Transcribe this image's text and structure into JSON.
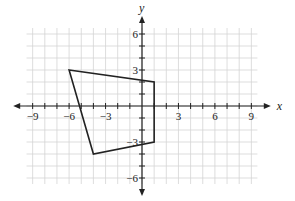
{
  "chart_data": {
    "type": "scatter",
    "title": "",
    "xlabel": "x",
    "ylabel": "y",
    "xlim": [
      -9.5,
      9.5
    ],
    "ylim": [
      -6.5,
      6.5
    ],
    "grid": true,
    "x_ticks": [
      -9,
      -6,
      -3,
      3,
      6,
      9
    ],
    "y_ticks": [
      6,
      3,
      -3,
      -6
    ],
    "x_tick_labels": [
      "−9",
      "−6",
      "−3",
      "3",
      "6",
      "9"
    ],
    "y_tick_labels": [
      "6",
      "3",
      "−3",
      "−6"
    ],
    "shapes": [
      {
        "name": "quadrilateral",
        "closed": true,
        "vertices": [
          [
            -6,
            3
          ],
          [
            1,
            2
          ],
          [
            1,
            -3
          ],
          [
            -4,
            -4
          ]
        ]
      }
    ]
  },
  "colors": {
    "grid": "#d4d4d4",
    "axis": "#222222",
    "shape": "#222222",
    "background": "#ffffff"
  }
}
